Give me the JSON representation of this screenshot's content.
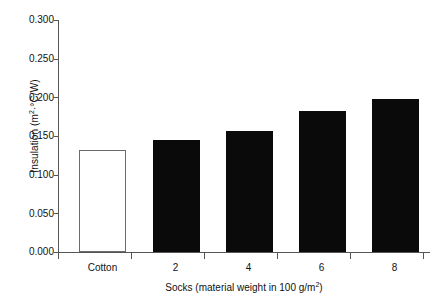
{
  "chart_data": {
    "type": "bar",
    "title": "",
    "categories": [
      "Cotton",
      "2",
      "4",
      "6",
      "8"
    ],
    "values": [
      0.132,
      0.145,
      0.157,
      0.183,
      0.198
    ],
    "series": [
      {
        "name": "Insulation",
        "values": [
          0.132,
          0.145,
          0.157,
          0.183,
          0.198
        ]
      }
    ],
    "bar_styles": [
      "hollow",
      "filled",
      "filled",
      "filled",
      "filled"
    ],
    "xlabel": "Socks (material weight in 100 g/m²)",
    "xlabel_parts": {
      "main": "Socks (material weight in 100 g/m",
      "sup": "2",
      "tail": ")"
    },
    "ylabel": "Insulation (m²·°C/W)",
    "ylabel_parts": {
      "lead": "Insulation (m",
      "sup": "2",
      "tail": "·°C/W)"
    },
    "ylim": [
      0.0,
      0.3
    ],
    "yticks": [
      "0.000",
      "0.050",
      "0.100",
      "0.150",
      "0.200",
      "0.250",
      "0.300"
    ],
    "ytick_values": [
      0.0,
      0.05,
      0.1,
      0.15,
      0.2,
      0.25,
      0.3
    ],
    "xtick_labels": [
      "Cotton",
      "2",
      "4",
      "6",
      "8"
    ],
    "grid": false,
    "legend": false,
    "legend_position": "none",
    "colors": {
      "bar_filled": "#0a0a0a",
      "bar_hollow_face": "#ffffff",
      "bar_hollow_edge": "#6b6b6b",
      "axis": "#555555",
      "text": "#111111",
      "background": "#ffffff"
    }
  }
}
